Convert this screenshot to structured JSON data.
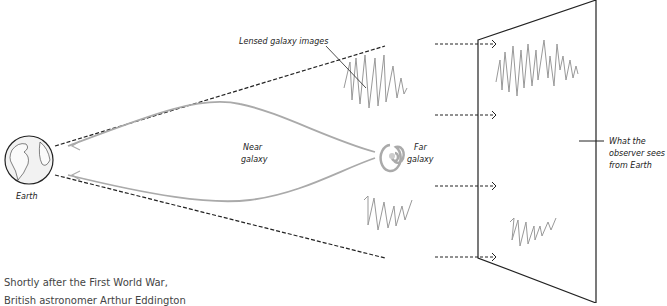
{
  "labels": {
    "lensed_images": "Lensed galaxy images",
    "near_galaxy_line1": "Near",
    "near_galaxy_line2": "galaxy",
    "far_galaxy_line1": "Far",
    "far_galaxy_line2": "galaxy",
    "earth": "Earth",
    "observer_line1": "What the",
    "observer_line2": "observer sees",
    "observer_line3": "from Earth"
  },
  "caption": {
    "line1": "Shortly after the First World War,",
    "line2": "British astronomer Arthur Eddington"
  },
  "colors": {
    "dashed_line": "#222222",
    "light_path": "#aaaaaa",
    "galaxy_image": "#999999",
    "frame": "#222222"
  }
}
